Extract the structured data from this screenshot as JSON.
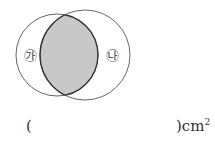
{
  "diagram": {
    "circle_a": {
      "label": "㉮",
      "cx": 57,
      "cy": 55,
      "r": 41
    },
    "circle_b": {
      "label": "㉯",
      "cx": 85,
      "cy": 55,
      "r": 45
    },
    "shaded_region": "intersection",
    "colors": {
      "stroke": "#555555",
      "shade": "#c8c8c8",
      "lens_stroke": "#333333"
    }
  },
  "answer": {
    "open_paren": "(",
    "close_paren": ")",
    "unit": "cm",
    "unit_exp": "2"
  }
}
